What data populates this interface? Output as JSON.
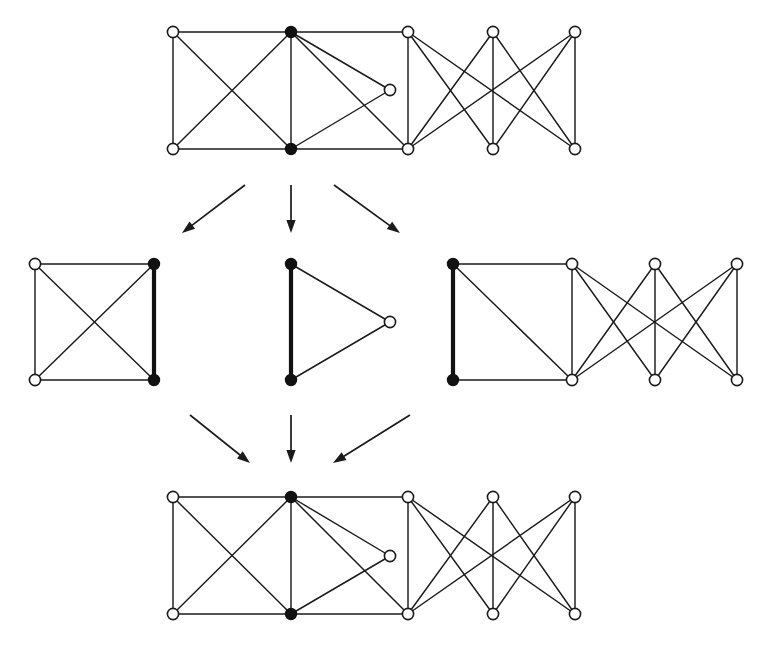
{
  "figure": {
    "canvas": {
      "width": 765,
      "height": 662
    },
    "colors": {
      "background": "#ffffff",
      "edge": "#1b1b1b",
      "bold_edge": "#121212",
      "node_fill_open": "#ffffff",
      "node_fill_solid": "#111111",
      "arrow": "#1b1b1b"
    },
    "style": {
      "node_radius_open": 5.6,
      "node_radius_solid": 5.4,
      "edge_width_thin": 1.45,
      "edge_width_bold": 4.2
    }
  },
  "graphs": [
    {
      "id": "top-graph",
      "name": "source-graph",
      "row": "top",
      "nodes": [
        {
          "id": "a1",
          "x": 173,
          "y": 32,
          "state": "open"
        },
        {
          "id": "a2",
          "x": 291,
          "y": 32,
          "state": "filled"
        },
        {
          "id": "a3",
          "x": 408,
          "y": 32,
          "state": "open"
        },
        {
          "id": "a4",
          "x": 493,
          "y": 32,
          "state": "open"
        },
        {
          "id": "a5",
          "x": 575,
          "y": 32,
          "state": "open"
        },
        {
          "id": "a6",
          "x": 390,
          "y": 90,
          "state": "open"
        },
        {
          "id": "b1",
          "x": 173,
          "y": 149,
          "state": "open"
        },
        {
          "id": "b2",
          "x": 291,
          "y": 149,
          "state": "filled"
        },
        {
          "id": "b3",
          "x": 408,
          "y": 149,
          "state": "open"
        },
        {
          "id": "b4",
          "x": 493,
          "y": 149,
          "state": "open"
        },
        {
          "id": "b5",
          "x": 575,
          "y": 149,
          "state": "open"
        }
      ],
      "edges": [
        {
          "from": "a1",
          "to": "a2",
          "weight": "thin"
        },
        {
          "from": "a2",
          "to": "a3",
          "weight": "thin"
        },
        {
          "from": "a1",
          "to": "b1",
          "weight": "thin"
        },
        {
          "from": "a1",
          "to": "b2",
          "weight": "thin"
        },
        {
          "from": "a2",
          "to": "b1",
          "weight": "thin"
        },
        {
          "from": "a2",
          "to": "b2",
          "weight": "thin"
        },
        {
          "from": "a2",
          "to": "a6",
          "weight": "thin"
        },
        {
          "from": "a2",
          "to": "b3",
          "weight": "thin"
        },
        {
          "from": "a6",
          "to": "b2",
          "weight": "thin"
        },
        {
          "from": "b1",
          "to": "b2",
          "weight": "thin"
        },
        {
          "from": "b2",
          "to": "b3",
          "weight": "thin"
        },
        {
          "from": "a3",
          "to": "b3",
          "weight": "thin"
        },
        {
          "from": "a3",
          "to": "b4",
          "weight": "thin"
        },
        {
          "from": "a3",
          "to": "b5",
          "weight": "thin"
        },
        {
          "from": "a4",
          "to": "b3",
          "weight": "thin"
        },
        {
          "from": "a4",
          "to": "b4",
          "weight": "thin"
        },
        {
          "from": "a4",
          "to": "b5",
          "weight": "thin"
        },
        {
          "from": "a5",
          "to": "b3",
          "weight": "thin"
        },
        {
          "from": "a5",
          "to": "b4",
          "weight": "thin"
        },
        {
          "from": "a5",
          "to": "b5",
          "weight": "thin"
        }
      ]
    },
    {
      "id": "mid-left-graph",
      "name": "k4-square-component",
      "row": "middle",
      "nodes": [
        {
          "id": "p1",
          "x": 35,
          "y": 264,
          "state": "open"
        },
        {
          "id": "p2",
          "x": 154,
          "y": 264,
          "state": "filled"
        },
        {
          "id": "p3",
          "x": 35,
          "y": 380,
          "state": "open"
        },
        {
          "id": "p4",
          "x": 154,
          "y": 380,
          "state": "filled"
        }
      ],
      "edges": [
        {
          "from": "p1",
          "to": "p2",
          "weight": "thin"
        },
        {
          "from": "p1",
          "to": "p3",
          "weight": "thin"
        },
        {
          "from": "p3",
          "to": "p4",
          "weight": "thin"
        },
        {
          "from": "p1",
          "to": "p4",
          "weight": "thin"
        },
        {
          "from": "p2",
          "to": "p3",
          "weight": "thin"
        },
        {
          "from": "p2",
          "to": "p4",
          "weight": "bold"
        }
      ]
    },
    {
      "id": "mid-center-graph",
      "name": "triangle-component",
      "row": "middle",
      "nodes": [
        {
          "id": "t1",
          "x": 291,
          "y": 264,
          "state": "filled"
        },
        {
          "id": "t2",
          "x": 291,
          "y": 380,
          "state": "filled"
        },
        {
          "id": "t3",
          "x": 390,
          "y": 322,
          "state": "open"
        }
      ],
      "edges": [
        {
          "from": "t1",
          "to": "t2",
          "weight": "bold"
        },
        {
          "from": "t1",
          "to": "t3",
          "weight": "thin"
        },
        {
          "from": "t2",
          "to": "t3",
          "weight": "thin"
        }
      ]
    },
    {
      "id": "mid-right-graph",
      "name": "bipartite-component",
      "row": "middle",
      "nodes": [
        {
          "id": "c1",
          "x": 453,
          "y": 264,
          "state": "filled"
        },
        {
          "id": "c2",
          "x": 572,
          "y": 264,
          "state": "open"
        },
        {
          "id": "c3",
          "x": 655,
          "y": 264,
          "state": "open"
        },
        {
          "id": "c4",
          "x": 737,
          "y": 264,
          "state": "open"
        },
        {
          "id": "d1",
          "x": 453,
          "y": 380,
          "state": "filled"
        },
        {
          "id": "d2",
          "x": 572,
          "y": 380,
          "state": "open"
        },
        {
          "id": "d3",
          "x": 655,
          "y": 380,
          "state": "open"
        },
        {
          "id": "d4",
          "x": 737,
          "y": 380,
          "state": "open"
        }
      ],
      "edges": [
        {
          "from": "c1",
          "to": "c2",
          "weight": "thin"
        },
        {
          "from": "c1",
          "to": "d1",
          "weight": "bold"
        },
        {
          "from": "c1",
          "to": "d2",
          "weight": "thin"
        },
        {
          "from": "d1",
          "to": "d2",
          "weight": "thin"
        },
        {
          "from": "c2",
          "to": "d2",
          "weight": "thin"
        },
        {
          "from": "c2",
          "to": "d3",
          "weight": "thin"
        },
        {
          "from": "c2",
          "to": "d4",
          "weight": "thin"
        },
        {
          "from": "c3",
          "to": "d2",
          "weight": "thin"
        },
        {
          "from": "c3",
          "to": "d3",
          "weight": "thin"
        },
        {
          "from": "c3",
          "to": "d4",
          "weight": "thin"
        },
        {
          "from": "c4",
          "to": "d2",
          "weight": "thin"
        },
        {
          "from": "c4",
          "to": "d3",
          "weight": "thin"
        },
        {
          "from": "c4",
          "to": "d4",
          "weight": "thin"
        }
      ]
    },
    {
      "id": "bottom-graph",
      "name": "result-graph",
      "row": "bottom",
      "nodes": [
        {
          "id": "e1",
          "x": 173,
          "y": 497,
          "state": "open"
        },
        {
          "id": "e2",
          "x": 291,
          "y": 497,
          "state": "filled"
        },
        {
          "id": "e3",
          "x": 408,
          "y": 497,
          "state": "open"
        },
        {
          "id": "e4",
          "x": 493,
          "y": 497,
          "state": "open"
        },
        {
          "id": "e5",
          "x": 575,
          "y": 497,
          "state": "open"
        },
        {
          "id": "e6",
          "x": 390,
          "y": 556,
          "state": "open"
        },
        {
          "id": "f1",
          "x": 173,
          "y": 614,
          "state": "open"
        },
        {
          "id": "f2",
          "x": 291,
          "y": 614,
          "state": "filled"
        },
        {
          "id": "f3",
          "x": 408,
          "y": 614,
          "state": "open"
        },
        {
          "id": "f4",
          "x": 493,
          "y": 614,
          "state": "open"
        },
        {
          "id": "f5",
          "x": 575,
          "y": 614,
          "state": "open"
        }
      ],
      "edges": [
        {
          "from": "e1",
          "to": "e2",
          "weight": "thin"
        },
        {
          "from": "e2",
          "to": "e3",
          "weight": "thin"
        },
        {
          "from": "e1",
          "to": "f1",
          "weight": "thin"
        },
        {
          "from": "e1",
          "to": "f2",
          "weight": "thin"
        },
        {
          "from": "e2",
          "to": "f1",
          "weight": "thin"
        },
        {
          "from": "e2",
          "to": "f2",
          "weight": "thin"
        },
        {
          "from": "e2",
          "to": "e6",
          "weight": "thin"
        },
        {
          "from": "e2",
          "to": "f3",
          "weight": "thin"
        },
        {
          "from": "e6",
          "to": "f2",
          "weight": "thin"
        },
        {
          "from": "f1",
          "to": "f2",
          "weight": "thin"
        },
        {
          "from": "f2",
          "to": "f3",
          "weight": "thin"
        },
        {
          "from": "e3",
          "to": "f3",
          "weight": "thin"
        },
        {
          "from": "e3",
          "to": "f4",
          "weight": "thin"
        },
        {
          "from": "e3",
          "to": "f5",
          "weight": "thin"
        },
        {
          "from": "e4",
          "to": "f3",
          "weight": "thin"
        },
        {
          "from": "e4",
          "to": "f4",
          "weight": "thin"
        },
        {
          "from": "e4",
          "to": "f5",
          "weight": "thin"
        },
        {
          "from": "e5",
          "to": "f3",
          "weight": "thin"
        },
        {
          "from": "e5",
          "to": "f4",
          "weight": "thin"
        },
        {
          "from": "e5",
          "to": "f5",
          "weight": "thin"
        }
      ]
    }
  ],
  "arrows": [
    {
      "id": "arrow-top-left",
      "name": "arrow-to-left-component",
      "x1": 245,
      "y1": 185,
      "x2": 182,
      "y2": 233,
      "direction": "down-left"
    },
    {
      "id": "arrow-top-center",
      "name": "arrow-to-center-component",
      "x1": 291,
      "y1": 185,
      "x2": 291,
      "y2": 233,
      "direction": "down"
    },
    {
      "id": "arrow-top-right",
      "name": "arrow-to-right-component",
      "x1": 334,
      "y1": 185,
      "x2": 400,
      "y2": 233,
      "direction": "down-right"
    },
    {
      "id": "arrow-bot-left",
      "name": "arrow-from-left-component",
      "x1": 190,
      "y1": 415,
      "x2": 250,
      "y2": 463,
      "direction": "down-right"
    },
    {
      "id": "arrow-bot-center",
      "name": "arrow-from-center-component",
      "x1": 291,
      "y1": 415,
      "x2": 291,
      "y2": 463,
      "direction": "down"
    },
    {
      "id": "arrow-bot-right",
      "name": "arrow-from-right-component",
      "x1": 410,
      "y1": 415,
      "x2": 333,
      "y2": 463,
      "direction": "down-left"
    }
  ]
}
